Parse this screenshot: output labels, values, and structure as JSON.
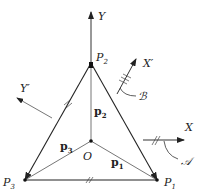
{
  "diagram": {
    "axes": {
      "Y": {
        "label": "Y"
      },
      "X": {
        "label": "X"
      },
      "Xp": {
        "label": "X′"
      },
      "Yp": {
        "label": "Y′"
      }
    },
    "points": {
      "P1": {
        "label": "P",
        "sub": "1"
      },
      "P2": {
        "label": "P",
        "sub": "2"
      },
      "P3": {
        "label": "P",
        "sub": "3"
      },
      "O": {
        "label": "O"
      }
    },
    "vectors": {
      "p1": {
        "label": "p",
        "sub": "1"
      },
      "p2": {
        "label": "p",
        "sub": "2"
      },
      "p3": {
        "label": "p",
        "sub": "3"
      }
    },
    "frames": {
      "A": {
        "label": "𝒜"
      },
      "B": {
        "label": "ℬ"
      }
    },
    "colors": {
      "line": "#222222",
      "thin": "#555555"
    }
  }
}
